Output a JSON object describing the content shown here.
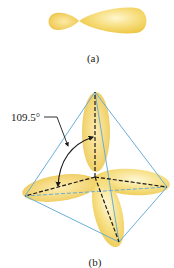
{
  "figure": {
    "panel_a": {
      "label": "(a)",
      "description": "single sp3 hybrid orbital",
      "orbital_color": "#f5d35a"
    },
    "panel_b": {
      "label": "(b)",
      "angle_label": "109.5°",
      "description": "four sp3 orbitals in a tetrahedron",
      "tetrahedron_edge_color": "#6aaed6",
      "orbital_color": "#f5d35a",
      "axis_color": "#1a1a1a"
    }
  }
}
